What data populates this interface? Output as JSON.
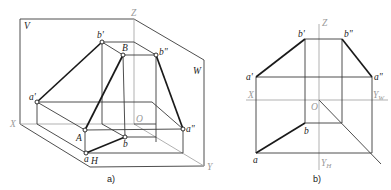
{
  "figure_a": {
    "caption": "a)",
    "planes": {
      "V": "V",
      "W": "W",
      "H": "H"
    },
    "axes": {
      "X": "X",
      "Y": "Y",
      "Z": "Z",
      "O": "O"
    },
    "points": {
      "a_prime": "a'",
      "b_prime": "b'",
      "A": "A",
      "B": "B",
      "b_dprime": "b\"",
      "a_dprime": "a\"",
      "a": "a",
      "b": "b"
    }
  },
  "figure_b": {
    "caption": "b)",
    "axes": {
      "X": "X",
      "Z": "Z",
      "O": "O",
      "YW": "Y",
      "YW_sub": "W",
      "YH": "Y",
      "YH_sub": "H"
    },
    "points": {
      "a_prime": "a'",
      "b_prime": "b'",
      "b_dprime": "b\"",
      "a_dprime": "a\"",
      "a": "a",
      "b": "b"
    }
  }
}
